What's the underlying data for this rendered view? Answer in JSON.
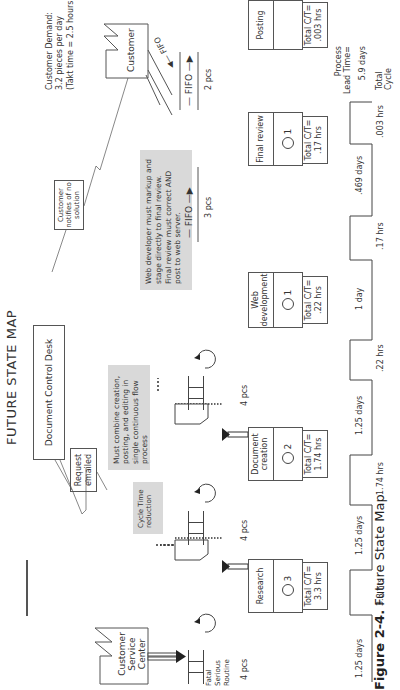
{
  "title": "FUTURE STATE MAP",
  "caption": {
    "label": "Figure 2-4.",
    "text": "Future State Map"
  },
  "customer_service_center": {
    "label": "Customer Service Center"
  },
  "customer": {
    "label": "Customer"
  },
  "document_control_desk": {
    "label": "Document Control Desk"
  },
  "request_emailed": {
    "label": "Request emailed"
  },
  "customer_notifies": {
    "label": "Customer notifies of no solution"
  },
  "customer_demand": {
    "line1": "Customer Demand:",
    "line2": "3.2 pieces per day",
    "line3": "(Takt time = 2.5 hours)"
  },
  "priorities": [
    "Fatal",
    "Serious",
    "Routine"
  ],
  "notes": {
    "cycle_time": "Cycle Time reduction",
    "combine": "Must combine creation, posting, and editing in single continuous flow process",
    "web_dev": "Web developer must markup and stage directly to final review. Final review must correct AND post to web server."
  },
  "processes": [
    {
      "name": "Research",
      "operators": "3",
      "ct_label": "Total C/T=",
      "ct_value": "3.3 hrs"
    },
    {
      "name": "Document creation",
      "operators": "2",
      "ct_label": "Total C/T=",
      "ct_value": "1.74 hrs"
    },
    {
      "name": "Web development",
      "operators": "1",
      "ct_label": "Total C/T=",
      "ct_value": ".22 hrs"
    },
    {
      "name": "Final review",
      "operators": "1",
      "ct_label": "Total C/T=",
      "ct_value": ".17 hrs"
    },
    {
      "name": "Posting",
      "operators": "",
      "ct_label": "Total C/T=",
      "ct_value": ".003 hrs"
    }
  ],
  "inventories": [
    {
      "label": "4 pcs"
    },
    {
      "label": "4 pcs"
    },
    {
      "label": "4 pcs"
    }
  ],
  "fifo": [
    {
      "label": "FIFO",
      "count": "3 pcs"
    },
    {
      "label": "FIFO",
      "count": "2 pcs"
    },
    {
      "label": "FIFO"
    }
  ],
  "timeline": {
    "wait": [
      "1.25 days",
      "1.25 days",
      "1.25 days",
      "1 day",
      ".469 days"
    ],
    "process": [
      "3.3 hrs",
      "1.74 hrs",
      ".22 hrs",
      ".17 hrs",
      ".003 hrs"
    ],
    "lead_time_label": "Process Lead Time=",
    "lead_time_value": "5.9 days",
    "total_cycle_label": "Total Cycle"
  }
}
